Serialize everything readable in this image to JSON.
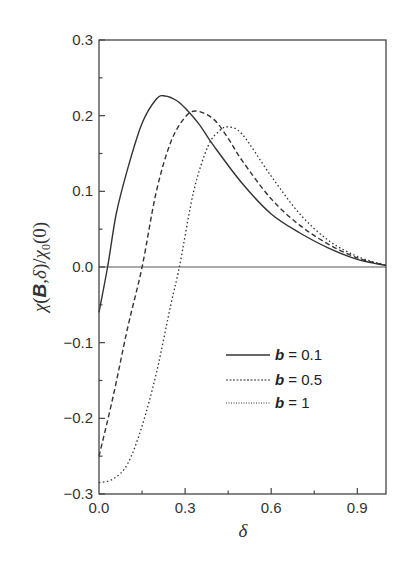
{
  "chart_data": {
    "type": "line",
    "title": "",
    "xlabel": "δ",
    "ylabel": "χ(B,δ)/χ0(0)",
    "xlim": [
      0.0,
      1.0
    ],
    "ylim": [
      -0.3,
      0.3
    ],
    "x_ticks": [
      "0.0",
      "0.3",
      "0.6",
      "0.9"
    ],
    "y_ticks": [
      "0.3",
      "0.2",
      "0.1",
      "0.0",
      "-0.1",
      "-0.2",
      "-0.3"
    ],
    "grid": false,
    "reference_line": {
      "y": 0.0
    },
    "legend_position": "lower right",
    "series": [
      {
        "name": "b = 0.1",
        "style": "solid",
        "x": [
          0.0,
          0.03,
          0.06,
          0.1,
          0.15,
          0.2,
          0.23,
          0.27,
          0.3,
          0.35,
          0.4,
          0.5,
          0.6,
          0.7,
          0.8,
          0.9,
          1.0
        ],
        "values": [
          -0.06,
          0.0,
          0.07,
          0.13,
          0.19,
          0.222,
          0.226,
          0.22,
          0.21,
          0.188,
          0.16,
          0.11,
          0.07,
          0.045,
          0.025,
          0.01,
          0.002
        ]
      },
      {
        "name": "b = 0.5",
        "style": "dashed",
        "x": [
          0.0,
          0.05,
          0.1,
          0.15,
          0.2,
          0.25,
          0.3,
          0.34,
          0.4,
          0.45,
          0.5,
          0.6,
          0.7,
          0.8,
          0.9,
          1.0
        ],
        "values": [
          -0.25,
          -0.17,
          -0.08,
          0.0,
          0.1,
          0.165,
          0.198,
          0.206,
          0.195,
          0.17,
          0.14,
          0.09,
          0.055,
          0.03,
          0.012,
          0.002
        ]
      },
      {
        "name": "b = 1",
        "style": "dotted",
        "x": [
          0.0,
          0.05,
          0.1,
          0.15,
          0.2,
          0.25,
          0.28,
          0.33,
          0.38,
          0.42,
          0.45,
          0.5,
          0.6,
          0.7,
          0.8,
          0.9,
          1.0
        ],
        "values": [
          -0.285,
          -0.28,
          -0.26,
          -0.21,
          -0.14,
          -0.05,
          0.0,
          0.1,
          0.16,
          0.18,
          0.185,
          0.175,
          0.12,
          0.07,
          0.035,
          0.014,
          0.002
        ]
      }
    ]
  },
  "legend": {
    "items": [
      {
        "var": "b",
        "text": " = 0.1"
      },
      {
        "var": "b",
        "text": " = 0.5"
      },
      {
        "var": "b",
        "text": " = 1"
      }
    ]
  },
  "axes": {
    "xlabel": "δ",
    "ylabel_parts": {
      "chi": "χ",
      "open": "(",
      "B": "B",
      "comma": ",",
      "delta": "δ",
      "close": ")/",
      "chi2": "χ",
      "sub": "0",
      "tail": "(0)"
    }
  },
  "colors": {
    "axis": "#444444",
    "series": "#333333"
  }
}
